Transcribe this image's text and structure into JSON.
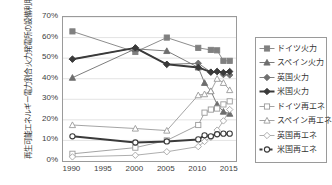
{
  "chart_data": {
    "type": "line",
    "title": "",
    "xlabel": "",
    "ylabel": "火力発電所の設備利用率 / 再生可能エネルギー電力割合",
    "ylabel_lines": [
      "火力発電所の設備利用率",
      "再生可能エネルギー電力割合"
    ],
    "x": [
      1990,
      1995,
      2000,
      2005,
      2010,
      2015
    ],
    "xlim": [
      1988.5,
      2016
    ],
    "ylim": [
      0,
      0.7
    ],
    "yticks": [
      "0%",
      "10%",
      "20%",
      "30%",
      "40%",
      "50%",
      "60%",
      "70%"
    ],
    "ytick_values": [
      0,
      10,
      20,
      30,
      40,
      50,
      60,
      70
    ],
    "xticks": [
      "1990",
      "1995",
      "2000",
      "2005",
      "2010",
      "2015"
    ],
    "grid": "horizontal",
    "legend_position": "right",
    "series": [
      {
        "name": "ドイツ火力",
        "marker": "square-filled",
        "color": "#808080",
        "line_width": 0.9,
        "points": [
          [
            1990,
            63.0
          ],
          [
            2000,
            53.0
          ],
          [
            2005,
            60.0
          ],
          [
            2010,
            55.0
          ],
          [
            2012,
            54.0
          ],
          [
            2013,
            53.8
          ],
          [
            2014,
            48.7
          ],
          [
            2015,
            48.7
          ]
        ]
      },
      {
        "name": "スペイン火力",
        "marker": "triangle-filled",
        "color": "#6e6e6e",
        "line_width": 0.9,
        "points": [
          [
            1990,
            40.5
          ],
          [
            2000,
            54.5
          ],
          [
            2005,
            53.5
          ],
          [
            2010,
            45.5
          ],
          [
            2011,
            38.0
          ],
          [
            2012,
            34.0
          ],
          [
            2013,
            27.5
          ],
          [
            2014,
            24.0
          ],
          [
            2015,
            23.0
          ]
        ]
      },
      {
        "name": "英国火力",
        "marker": "diamond-filled",
        "color": "#707070",
        "line_width": 0.9,
        "points": [
          [
            1990,
            49.5
          ],
          [
            2000,
            55.0
          ],
          [
            2005,
            47.0
          ],
          [
            2010,
            47.5
          ],
          [
            2012,
            43.2
          ],
          [
            2013,
            43.5
          ],
          [
            2014,
            42.0
          ],
          [
            2015,
            41.8
          ]
        ]
      },
      {
        "name": "米国火力",
        "marker": "diamond-filled-bold",
        "color": "#3a3a3a",
        "line_width": 2.0,
        "points": [
          [
            1990,
            49.5
          ],
          [
            2000,
            55.0
          ],
          [
            2005,
            47.0
          ],
          [
            2010,
            45.5
          ],
          [
            2012,
            43.2
          ],
          [
            2013,
            43.5
          ],
          [
            2014,
            43.0
          ],
          [
            2015,
            43.5
          ]
        ]
      },
      {
        "name": "ドイツ再エネ",
        "marker": "square-hollow",
        "color": "#9a9a9a",
        "line_width": 0.9,
        "points": [
          [
            1990,
            3.5
          ],
          [
            2000,
            6.5
          ],
          [
            2005,
            10.0
          ],
          [
            2010,
            17.5
          ],
          [
            2011,
            23.5
          ],
          [
            2012,
            25.0
          ],
          [
            2013,
            25.5
          ],
          [
            2014,
            27.5
          ],
          [
            2015,
            29.0
          ]
        ]
      },
      {
        "name": "スペイン再エネ",
        "marker": "triangle-hollow",
        "color": "#9a9a9a",
        "line_width": 0.9,
        "points": [
          [
            1990,
            17.5
          ],
          [
            2000,
            15.8
          ],
          [
            2005,
            14.8
          ],
          [
            2010,
            32.0
          ],
          [
            2011,
            32.5
          ],
          [
            2012,
            34.0
          ],
          [
            2013,
            40.0
          ],
          [
            2014,
            38.0
          ],
          [
            2015,
            34.5
          ]
        ]
      },
      {
        "name": "英国再エネ",
        "marker": "diamond-hollow",
        "color": "#a5a5a5",
        "line_width": 0.9,
        "points": [
          [
            1990,
            2.0
          ],
          [
            2000,
            2.8
          ],
          [
            2005,
            4.5
          ],
          [
            2010,
            7.0
          ],
          [
            2011,
            9.5
          ],
          [
            2012,
            11.5
          ],
          [
            2013,
            15.0
          ],
          [
            2014,
            19.5
          ],
          [
            2015,
            25.0
          ]
        ]
      },
      {
        "name": "米国再エネ",
        "marker": "circle-hollow-bold",
        "color": "#3a3a3a",
        "line_width": 2.0,
        "points": [
          [
            1990,
            12.0
          ],
          [
            2000,
            9.0
          ],
          [
            2005,
            9.5
          ],
          [
            2010,
            10.5
          ],
          [
            2011,
            12.5
          ],
          [
            2012,
            12.0
          ],
          [
            2013,
            13.0
          ],
          [
            2014,
            13.3
          ],
          [
            2015,
            13.3
          ]
        ]
      }
    ]
  }
}
